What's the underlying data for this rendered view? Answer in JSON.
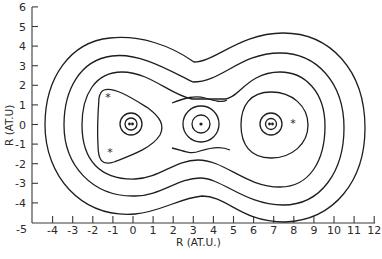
{
  "chart_data": {
    "type": "contour",
    "title": "",
    "xlabel": "R (AT.U.)",
    "ylabel": "R (AT.U)",
    "xlim": [
      -5,
      12
    ],
    "ylim": [
      -5,
      6
    ],
    "x_ticks": [
      "-5",
      "-4",
      "-3",
      "-2",
      "-1",
      "0",
      "1",
      "2",
      "3",
      "4",
      "5",
      "6",
      "7",
      "8",
      "9",
      "10",
      "11",
      "12"
    ],
    "y_ticks": [
      "6",
      "5",
      "4",
      "3",
      "2",
      "1",
      "0",
      "-1",
      "-2",
      "-3",
      "-4",
      "-5"
    ],
    "grid": false,
    "nuclei": [
      {
        "marker": "double-dot",
        "x": -0.1,
        "y": 0.0
      },
      {
        "marker": "dot",
        "x": 3.4,
        "y": 0.0
      },
      {
        "marker": "double-dot",
        "x": 6.9,
        "y": 0.0
      }
    ],
    "asterisks": [
      {
        "x": -1.2,
        "y": 1.4
      },
      {
        "x": -1.1,
        "y": -1.4
      },
      {
        "x": 8.0,
        "y": 0.1
      }
    ],
    "contours": {
      "outer_levels": 4,
      "small_circles_left": 2,
      "small_circles_middle": 2,
      "small_circles_right": 3
    }
  }
}
